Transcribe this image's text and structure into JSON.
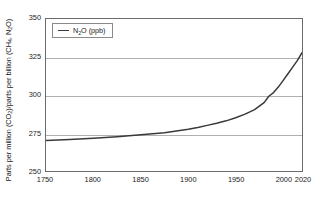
{
  "chart_data": {
    "type": "line",
    "title": "",
    "xlabel": "",
    "ylabel": "Parts per million (CO2)/parts per billion (CH4, N2O)",
    "ylabel_parts": {
      "a": "Parts per million (CO",
      "sub1": "2",
      "b": ")/parts per billion (CH",
      "sub2": "4",
      "c": ", N",
      "sub3": "2",
      "d": "O)"
    },
    "xlim": [
      1750,
      2020
    ],
    "ylim": [
      250,
      350
    ],
    "grid": "horizontal",
    "legend_position": "top-left-inside",
    "x_ticks": [
      1750,
      1800,
      1850,
      1900,
      1950,
      2000,
      2020
    ],
    "x_tick_labels": [
      "1750",
      "1800",
      "1850",
      "1900",
      "1950",
      "2000",
      "2020"
    ],
    "y_ticks": [
      250,
      275,
      300,
      325,
      350
    ],
    "y_tick_labels": [
      "250",
      "275",
      "300",
      "325",
      "350"
    ],
    "gridline_values": [
      275,
      300,
      325
    ],
    "series": [
      {
        "name": "N2O (ppb)",
        "name_parts": {
          "a": "N",
          "sub": "2",
          "b": "O (ppb)"
        },
        "color": "#3a3a3a",
        "x": [
          1750,
          1775,
          1800,
          1825,
          1850,
          1875,
          1900,
          1910,
          1920,
          1930,
          1940,
          1950,
          1960,
          1970,
          1980,
          1985,
          1990,
          1995,
          2000,
          2005,
          2010,
          2015,
          2020
        ],
        "values": [
          270.0,
          270.8,
          271.6,
          272.6,
          273.8,
          275.2,
          277.4,
          278.6,
          280.0,
          281.4,
          283.0,
          285.0,
          287.4,
          290.4,
          295.0,
          299.2,
          301.6,
          305.2,
          309.5,
          313.8,
          318.2,
          322.6,
          327.8
        ]
      }
    ],
    "legend": [
      {
        "label": "N2O (ppb)",
        "color": "#3a3a3a"
      }
    ],
    "colors": {
      "series_line": "#3a3a3a",
      "gridline": "#b0b0b0",
      "axis_border": "#6b6b6b",
      "text": "#222222",
      "background": "#ffffff"
    }
  }
}
